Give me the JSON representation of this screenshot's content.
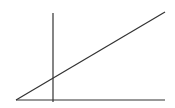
{
  "diagram": {
    "background": "#ffffff",
    "stroke_color": "#333333",
    "stroke_width": 1.2,
    "lines": [
      {
        "name": "baseline",
        "x1": 16,
        "y1": 100,
        "x2": 165,
        "y2": 100
      },
      {
        "name": "vertical-line",
        "x1": 53,
        "y1": 13,
        "x2": 53,
        "y2": 102
      },
      {
        "name": "diagonal-line",
        "x1": 16,
        "y1": 100,
        "x2": 165,
        "y2": 12
      }
    ]
  }
}
